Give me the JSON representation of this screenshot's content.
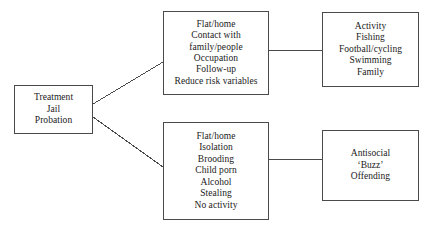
{
  "diagram": {
    "background_color": "#ffffff",
    "border_color": "#4a4a4a",
    "text_color": "#1a1a1a",
    "nodes": {
      "source": {
        "name": "Treatment / Jail / Probation",
        "lines": [
          "Treatment",
          "Jail",
          "Probation"
        ]
      },
      "positive": {
        "name": "Positive lifestyle factors",
        "lines": [
          "Flat/home",
          "Contact with",
          "family/people",
          "Occupation",
          "Follow-up",
          "Reduce risk variables"
        ]
      },
      "activity": {
        "name": "Positive outcomes",
        "lines": [
          "Activity",
          "Fishing",
          "Football/cycling",
          "Swimming",
          "Family"
        ]
      },
      "negative": {
        "name": "Negative lifestyle factors",
        "lines": [
          "Flat/home",
          "Isolation",
          "Brooding",
          "Child porn",
          "Alcohol",
          "Stealing",
          "No activity"
        ]
      },
      "outcome": {
        "name": "Negative outcomes",
        "lines": [
          "Antisocial",
          "‘Buzz’",
          "Offending"
        ]
      }
    },
    "connectors": [
      {
        "name": "source-to-positive",
        "type": "diagonal",
        "from": "source",
        "to": "positive"
      },
      {
        "name": "source-to-negative",
        "type": "diagonal",
        "from": "source",
        "to": "negative"
      },
      {
        "name": "positive-to-activity",
        "type": "horizontal",
        "from": "positive",
        "to": "activity"
      },
      {
        "name": "negative-to-outcome",
        "type": "horizontal",
        "from": "negative",
        "to": "outcome"
      }
    ]
  }
}
